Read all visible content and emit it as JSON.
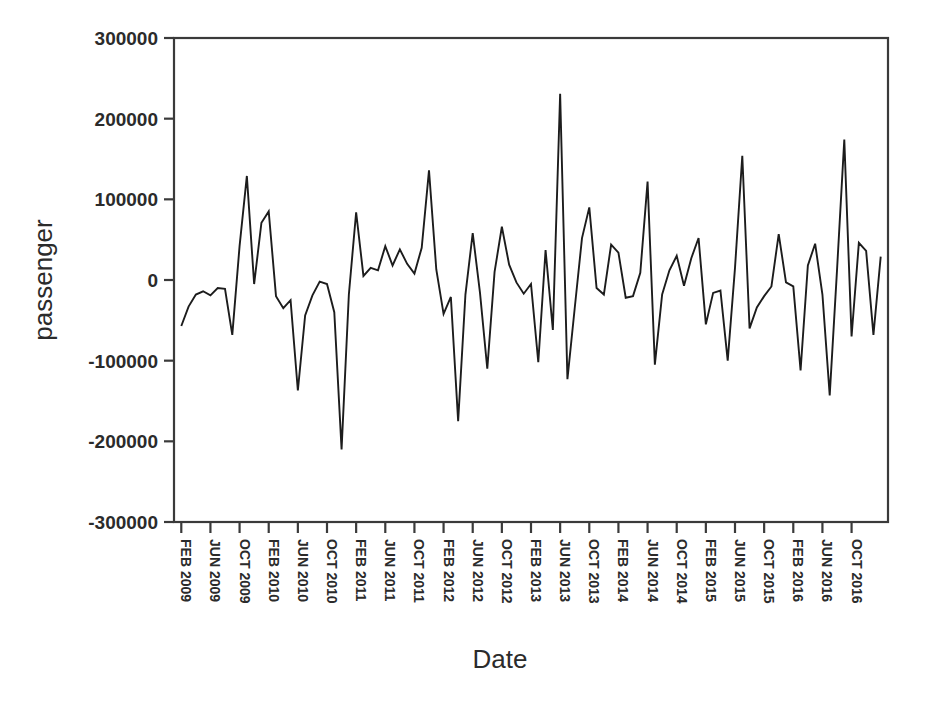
{
  "chart_data": {
    "type": "line",
    "title": "",
    "subtitle": "",
    "xlabel": "Date",
    "ylabel": "passenger",
    "grid": false,
    "legend": null,
    "ylim": [
      -300000,
      300000
    ],
    "ytick_labels": [
      "300000",
      "200000",
      "100000",
      "0",
      "-100000",
      "-200000",
      "-300000"
    ],
    "ytick_values": [
      300000,
      200000,
      100000,
      0,
      -100000,
      -200000,
      -300000
    ],
    "xtick_labels": [
      "FEB 2009",
      "JUN 2009",
      "OCT 2009",
      "FEB 2010",
      "JUN 2010",
      "OCT 2010",
      "FEB 2011",
      "JUN 2011",
      "OCT 2011",
      "FEB 2012",
      "JUN 2012",
      "OCT 2012",
      "FEB 2013",
      "JUN 2013",
      "OCT 2013",
      "FEB 2014",
      "JUN 2014",
      "OCT 2014",
      "FEB 2015",
      "JUN 2015",
      "OCT 2015",
      "FEB 2016",
      "JUN 2016",
      "OCT 2016"
    ],
    "xtick_step_months": 4,
    "x_start_label": "FEB 2009",
    "x_end_label": "OCT 2016",
    "series": [
      {
        "name": "passenger",
        "values": [
          -57000,
          -33000,
          -18000,
          -14000,
          -19000,
          -10000,
          -11000,
          -68000,
          42000,
          129000,
          -5000,
          71000,
          85000,
          -20000,
          -35000,
          -25000,
          -137000,
          -44000,
          -19000,
          -2000,
          -5000,
          -40000,
          -210000,
          -18000,
          84000,
          5000,
          15000,
          12000,
          42000,
          18000,
          38000,
          20000,
          8000,
          40000,
          136000,
          13000,
          -42000,
          -21000,
          -175000,
          -18000,
          58000,
          -16000,
          -110000,
          10000,
          66000,
          19000,
          -3000,
          -17000,
          -5000,
          -102000,
          37000,
          -62000,
          231000,
          -123000,
          -35000,
          52000,
          90000,
          -10000,
          -18000,
          44000,
          34000,
          -22000,
          -20000,
          9000,
          122000,
          -105000,
          -18000,
          12000,
          30000,
          -7000,
          27000,
          52000,
          -55000,
          -16000,
          -13000,
          -100000,
          15000,
          154000,
          -60000,
          -34000,
          -20000,
          -8000,
          57000,
          -3000,
          -8000,
          -112000,
          18000,
          45000,
          -18000,
          -143000,
          12000,
          174000,
          -70000,
          46000,
          36000,
          -68000,
          29000
        ]
      }
    ]
  },
  "figure": {
    "y_axis_title": "passenger",
    "x_axis_title": "Date"
  }
}
